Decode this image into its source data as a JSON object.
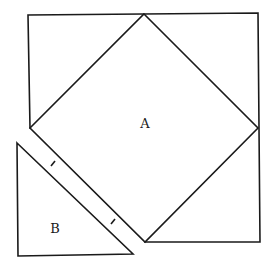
{
  "diagram": {
    "stroke_color": "#1a1a1a",
    "background": "#ffffff",
    "labels": {
      "a": "A",
      "b": "B"
    },
    "outer_square": {
      "points": [
        [
          28,
          15
        ],
        [
          258,
          13
        ],
        [
          260,
          242
        ],
        [
          145,
          242
        ]
      ],
      "open_corner": "bottom-left (triangle B removed)"
    },
    "inner_square_A": {
      "points": [
        [
          144,
          14
        ],
        [
          258,
          128
        ],
        [
          145,
          242
        ],
        [
          30,
          128
        ]
      ]
    },
    "triangle_B": {
      "points": [
        [
          17,
          143
        ],
        [
          133,
          254
        ],
        [
          18,
          256
        ]
      ]
    },
    "tick_marks": [
      {
        "center": [
          53,
          164
        ],
        "meaning": "equal length"
      },
      {
        "center": [
          113,
          221
        ],
        "meaning": "equal length"
      }
    ]
  }
}
